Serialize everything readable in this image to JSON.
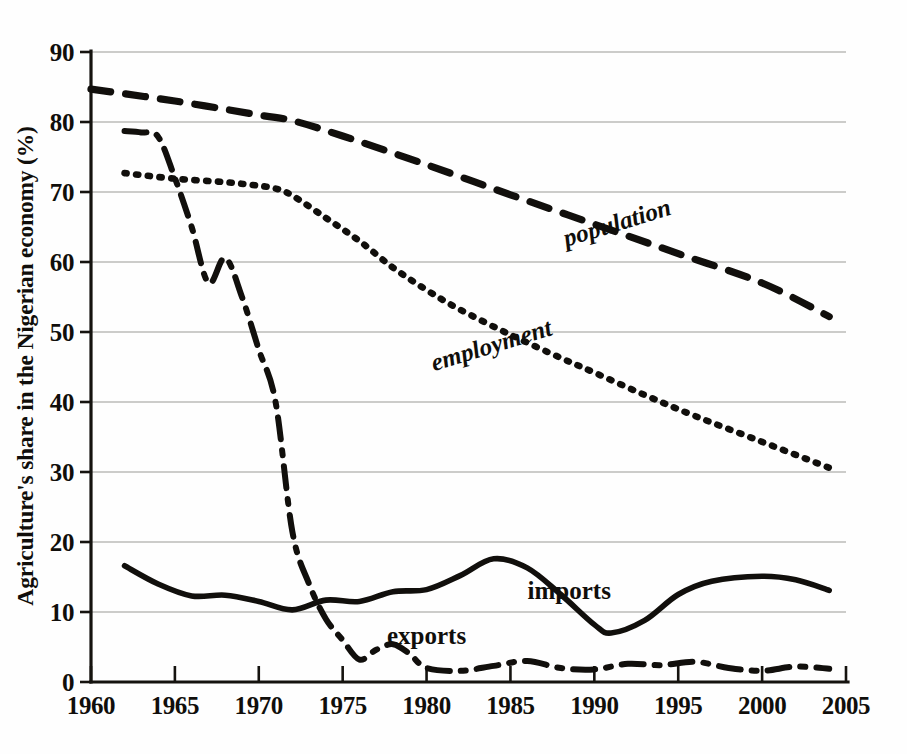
{
  "chart_data": {
    "type": "line",
    "title": "",
    "xlabel": "",
    "ylabel": "Agriculture's share in the Nigerian economy (%)",
    "xlim": [
      1960,
      2005
    ],
    "ylim": [
      0,
      90
    ],
    "grid": true,
    "legend_position": "inline-labels",
    "x_ticks": [
      "1960",
      "1965",
      "1970",
      "1975",
      "1980",
      "1985",
      "1990",
      "1995",
      "2000",
      "2005"
    ],
    "y_ticks": [
      "0",
      "10",
      "20",
      "30",
      "40",
      "50",
      "60",
      "70",
      "80",
      "90"
    ],
    "series": [
      {
        "name": "population",
        "label": "population",
        "style": "dashed",
        "color": "#110f0c",
        "x": [
          1960,
          1965,
          1970,
          1972,
          1975,
          1980,
          1985,
          1990,
          1995,
          2000,
          2004
        ],
        "values": [
          84.7,
          83.0,
          81.0,
          80.2,
          78.0,
          73.9,
          69.6,
          65.4,
          61.2,
          57.0,
          52.2
        ]
      },
      {
        "name": "employment",
        "label": "employment",
        "style": "dotted",
        "color": "#110f0c",
        "x": [
          1962,
          1965,
          1968,
          1970,
          1971,
          1972,
          1974,
          1976,
          1978,
          1980,
          1982,
          1985,
          1988,
          1990,
          1993,
          1996,
          2000,
          2004
        ],
        "values": [
          72.7,
          71.9,
          71.4,
          70.9,
          70.5,
          69.5,
          66.3,
          63.0,
          59.2,
          56.0,
          53.2,
          49.6,
          46.3,
          44.2,
          41.0,
          38.0,
          34.3,
          30.6
        ]
      },
      {
        "name": "imports",
        "label": "imports",
        "style": "solid",
        "color": "#110f0c",
        "x": [
          1962,
          1964,
          1966,
          1968,
          1970,
          1972,
          1974,
          1976,
          1978,
          1980,
          1982,
          1984,
          1986,
          1988,
          1990,
          1991,
          1993,
          1995,
          1997,
          2000,
          2002,
          2004
        ],
        "values": [
          16.6,
          14.0,
          12.3,
          12.4,
          11.5,
          10.3,
          11.7,
          11.5,
          12.9,
          13.2,
          15.2,
          17.6,
          16.3,
          12.5,
          8.2,
          7.0,
          8.8,
          12.5,
          14.4,
          15.1,
          14.6,
          13.1
        ]
      },
      {
        "name": "exports",
        "label": "exports",
        "style": "dash-dot",
        "color": "#110f0c",
        "x": [
          1962,
          1963,
          1964,
          1965,
          1966,
          1967,
          1968,
          1969,
          1970,
          1971,
          1972,
          1973,
          1974,
          1975,
          1976,
          1977,
          1978,
          1979,
          1980,
          1982,
          1984,
          1986,
          1988,
          1990,
          1992,
          1994,
          1996,
          1998,
          2000,
          2002,
          2004
        ],
        "values": [
          78.7,
          78.5,
          77.9,
          72.0,
          65.0,
          57.0,
          60.6,
          55.0,
          47.5,
          40.0,
          21.5,
          14.0,
          9.0,
          6.0,
          3.2,
          4.6,
          5.4,
          4.0,
          2.0,
          1.6,
          2.3,
          3.0,
          2.0,
          1.8,
          2.6,
          2.4,
          2.9,
          2.0,
          1.6,
          2.2,
          1.9
        ]
      }
    ],
    "annotations": [
      {
        "name": "population-label",
        "text": "population",
        "x": 1991.5,
        "y": 64.5,
        "rotation": -17
      },
      {
        "name": "employment-label",
        "text": "employment",
        "x": 1984.0,
        "y": 47.0,
        "rotation": -17
      },
      {
        "name": "imports-label",
        "text": "imports",
        "x": 1988.5,
        "y": 11.8,
        "rotation": 0
      },
      {
        "name": "exports-label",
        "text": "exports",
        "x": 1980.0,
        "y": 5.4,
        "rotation": 0
      }
    ]
  }
}
